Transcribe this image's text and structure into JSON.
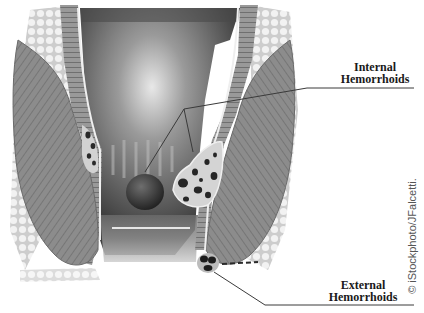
{
  "diagram": {
    "labels": [
      {
        "id": "internal",
        "line1": "Internal",
        "line2": "Hemorrhoids"
      },
      {
        "id": "external",
        "line1": "External",
        "line2": "Hemorrhoids"
      }
    ],
    "credit": "© iStockphoto/JFalcetti."
  },
  "colors": {
    "muscle": "#8a8a8a",
    "muscle_dark": "#5e5e5e",
    "lumen": "#6b6b6b",
    "highlight": "#d6d6d6",
    "fat": "#e4e4e4",
    "vessel_fill": "#cfcfcf",
    "hemorrhoid": "#2e2e2e",
    "leader_line": "#3a3a3a"
  }
}
